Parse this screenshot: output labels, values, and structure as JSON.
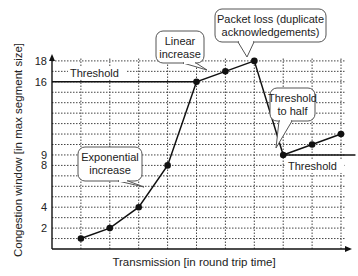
{
  "chart_data": {
    "type": "line",
    "title": "",
    "xlabel": "Transmission [in round trip time]",
    "ylabel": "Congestion window [in max segment size]",
    "x": [
      1,
      2,
      3,
      4,
      5,
      6,
      7,
      8,
      9,
      10
    ],
    "series": [
      {
        "name": "Congestion window",
        "values": [
          1,
          2,
          4,
          8,
          16,
          17,
          18,
          9,
          10,
          11
        ]
      }
    ],
    "y_ticks": [
      2,
      4,
      8,
      9,
      16,
      18
    ],
    "ylim": [
      0,
      18
    ],
    "xlim": [
      0,
      10.6
    ],
    "grid": true,
    "thresholds": [
      {
        "label": "Threshold",
        "value": 16,
        "x_start": 0,
        "x_end": 5
      },
      {
        "label": "Threshold",
        "value": 9,
        "x_start": 8,
        "x_end": 10.5
      }
    ],
    "annotations": [
      {
        "id": "exponential",
        "lines": [
          "Exponential",
          "increase"
        ]
      },
      {
        "id": "linear",
        "lines": [
          "Linear",
          "increase"
        ]
      },
      {
        "id": "packet_loss",
        "lines": [
          "Packet loss (duplicate",
          "acknowledgements)"
        ]
      },
      {
        "id": "threshold_half",
        "lines": [
          "Threshold",
          "to half"
        ]
      }
    ]
  }
}
